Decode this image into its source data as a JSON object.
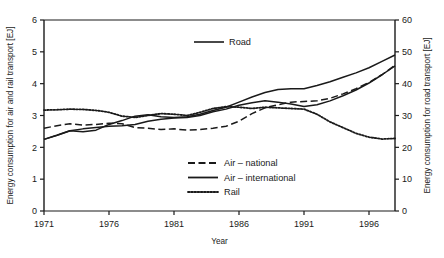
{
  "chart_data": {
    "type": "line",
    "title": "",
    "xlabel": "Year",
    "ylabel_left": "Energy consumption for air and rail transport [EJ]",
    "ylabel_right": "Energy consumption for road transport [EJ]",
    "xlim": [
      1971,
      1998
    ],
    "ylim_left": [
      0,
      6
    ],
    "ylim_right": [
      0,
      60
    ],
    "xticks": [
      1971,
      1976,
      1981,
      1986,
      1991,
      1996
    ],
    "xtick_labels": [
      "1971",
      "1976",
      "1981",
      "1986",
      "1991",
      "1996"
    ],
    "yticks_left": [
      0,
      1,
      2,
      3,
      4,
      5,
      6
    ],
    "ytick_labels_left": [
      "0",
      "1",
      "2",
      "3",
      "4",
      "5",
      "6"
    ],
    "yticks_right": [
      0,
      10,
      20,
      30,
      40,
      50,
      60
    ],
    "ytick_labels_right": [
      "0",
      "10",
      "20",
      "30",
      "40",
      "50",
      "60"
    ],
    "grid": false,
    "legend_position": "lower-right",
    "x": [
      1971,
      1972,
      1973,
      1974,
      1975,
      1976,
      1977,
      1978,
      1979,
      1980,
      1981,
      1982,
      1983,
      1984,
      1985,
      1986,
      1987,
      1988,
      1989,
      1990,
      1991,
      1992,
      1993,
      1994,
      1995,
      1996,
      1997,
      1998
    ],
    "series": [
      {
        "name": "Road",
        "axis": "right",
        "style": "solid",
        "label_in_plot": "Road",
        "values": [
          22.5,
          23.8,
          25.2,
          24.9,
          25.4,
          27.2,
          28.4,
          29.8,
          30.2,
          29.6,
          29.4,
          29.6,
          30.4,
          31.6,
          32.6,
          34.2,
          35.8,
          37.2,
          38.2,
          38.4,
          38.4,
          39.4,
          40.6,
          42.0,
          43.4,
          45.0,
          47.0,
          49.0
        ]
      },
      {
        "name": "Air – national",
        "axis": "left",
        "style": "dashed",
        "values": [
          2.6,
          2.68,
          2.74,
          2.7,
          2.72,
          2.76,
          2.74,
          2.62,
          2.6,
          2.56,
          2.58,
          2.54,
          2.56,
          2.6,
          2.66,
          2.82,
          3.06,
          3.24,
          3.34,
          3.42,
          3.44,
          3.46,
          3.54,
          3.68,
          3.84,
          4.04,
          4.28,
          4.58
        ]
      },
      {
        "name": "Air – international",
        "axis": "left",
        "style": "solid",
        "values": [
          2.25,
          2.38,
          2.52,
          2.58,
          2.62,
          2.66,
          2.68,
          2.72,
          2.82,
          2.88,
          2.92,
          2.94,
          3.0,
          3.12,
          3.2,
          3.32,
          3.4,
          3.46,
          3.42,
          3.36,
          3.28,
          3.34,
          3.46,
          3.62,
          3.8,
          4.02,
          4.28,
          4.56
        ]
      },
      {
        "name": "Rail",
        "axis": "left",
        "style": "dotted",
        "values": [
          3.17,
          3.18,
          3.2,
          3.19,
          3.16,
          3.1,
          2.98,
          2.94,
          3.0,
          3.06,
          3.04,
          3.0,
          3.1,
          3.22,
          3.28,
          3.26,
          3.22,
          3.26,
          3.24,
          3.22,
          3.2,
          3.04,
          2.8,
          2.62,
          2.44,
          2.32,
          2.26,
          2.28
        ]
      }
    ],
    "legend_entries": [
      {
        "label": "Air – national",
        "style": "dashed"
      },
      {
        "label": "Air – international",
        "style": "solid"
      },
      {
        "label": "Rail",
        "style": "dotted"
      }
    ]
  }
}
